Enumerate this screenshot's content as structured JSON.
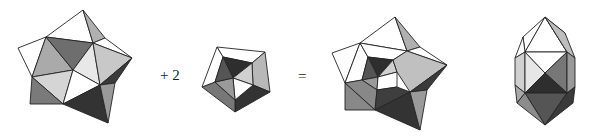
{
  "equation": {
    "plus_label": "+ 2",
    "equals_label": "="
  },
  "figures": [
    {
      "id": "polyhedron-a",
      "description": "large pentagonal polyhedron (shaded faces)"
    },
    {
      "id": "polyhedron-b",
      "description": "pentagonal cupola-like piece"
    },
    {
      "id": "polyhedron-combined",
      "description": "combined polyhedron"
    },
    {
      "id": "polyhedron-elongated",
      "description": "elongated bipyramid-like polyhedron"
    }
  ],
  "colors": {
    "white": "#ffffff",
    "light": "#d9d9d9",
    "mid": "#aaaaaa",
    "gray": "#888888",
    "dark": "#5a5a5a",
    "darkest": "#333333",
    "stroke": "#222222"
  }
}
